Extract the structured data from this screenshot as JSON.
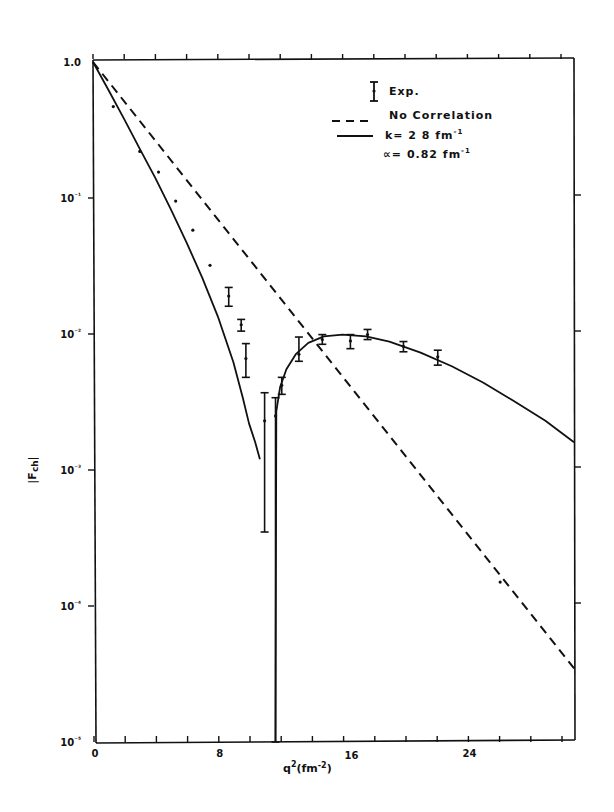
{
  "chart_data": {
    "type": "line",
    "title": "",
    "xlabel": "q²(fm⁻²)",
    "ylabel": "|F_ch|",
    "xscale": "linear",
    "yscale": "log",
    "xlim": [
      0,
      31
    ],
    "ylim": [
      1e-05,
      1.0
    ],
    "x_ticks": [
      0,
      8,
      16,
      24
    ],
    "x_tick_labels": [
      "0",
      "8",
      "16",
      "24"
    ],
    "x_minor_tick_step": 2,
    "y_ticks": [
      1.0,
      0.1,
      0.01,
      0.001,
      0.0001,
      1e-05
    ],
    "y_tick_labels": [
      "1.0",
      "10⁻¹",
      "10⁻²",
      "10⁻³",
      "10⁻⁴",
      "10⁻⁵"
    ],
    "grid": false,
    "legend_position": "upper right",
    "legend": [
      {
        "label": "Exp.",
        "style": "errorbar"
      },
      {
        "label": "No Correlation",
        "style": "dashed"
      },
      {
        "label": "k= 2 8 fm⁻¹",
        "style": "solid"
      },
      {
        "label": "α= 0.82 fm⁻¹",
        "style": "none"
      }
    ],
    "series": [
      {
        "name": "No Correlation",
        "style": "dashed",
        "x": [
          0,
          31
        ],
        "y": [
          1.0,
          3.3e-05
        ]
      },
      {
        "name": "k= 2 8 fm⁻¹, α= 0.82 fm⁻¹",
        "style": "solid",
        "segments": [
          {
            "x": [
              0,
              1,
              2,
              3,
              4,
              5,
              6,
              7,
              8,
              9,
              9.6,
              10,
              10.4,
              10.7
            ],
            "y": [
              1.0,
              0.62,
              0.38,
              0.23,
              0.14,
              0.082,
              0.047,
              0.026,
              0.0135,
              0.0062,
              0.0034,
              0.0022,
              0.0016,
              0.0012
            ]
          },
          {
            "x": [
              11.7,
              11.75,
              12.0,
              12.4,
              13.0,
              13.8,
              14.8,
              16.0,
              17.5,
              19.0,
              21.0,
              23.0,
              25.0,
              27.0,
              29.0,
              31.0
            ],
            "y": [
              1e-05,
              0.0027,
              0.0041,
              0.0055,
              0.0071,
              0.0086,
              0.0096,
              0.0099,
              0.0096,
              0.0088,
              0.0073,
              0.0058,
              0.0044,
              0.0032,
              0.0023,
              0.0016
            ]
          }
        ]
      },
      {
        "name": "Exp.",
        "style": "points_with_errorbars",
        "points": [
          {
            "x": 1.3,
            "y": 0.47
          },
          {
            "x": 3.0,
            "y": 0.22
          },
          {
            "x": 4.2,
            "y": 0.155
          },
          {
            "x": 5.3,
            "y": 0.095
          },
          {
            "x": 6.4,
            "y": 0.058
          },
          {
            "x": 7.5,
            "y": 0.032
          },
          {
            "x": 8.7,
            "y": 0.019,
            "ylo": 0.016,
            "yhi": 0.022
          },
          {
            "x": 9.5,
            "y": 0.0117,
            "ylo": 0.0105,
            "yhi": 0.0128
          },
          {
            "x": 9.8,
            "y": 0.0066,
            "ylo": 0.0048,
            "yhi": 0.0085
          },
          {
            "x": 11.0,
            "y": 0.0023,
            "ylo": 0.00035,
            "yhi": 0.0037
          },
          {
            "x": 11.7,
            "y": 0.0025,
            "ylo": 1e-05,
            "yhi": 0.0034
          },
          {
            "x": 12.1,
            "y": 0.0042,
            "ylo": 0.0036,
            "yhi": 0.0048
          },
          {
            "x": 13.2,
            "y": 0.0071,
            "ylo": 0.0063,
            "yhi": 0.0095
          },
          {
            "x": 14.7,
            "y": 0.0091,
            "ylo": 0.0084,
            "yhi": 0.0099
          },
          {
            "x": 16.5,
            "y": 0.0089,
            "ylo": 0.0078,
            "yhi": 0.0099
          },
          {
            "x": 17.6,
            "y": 0.0099,
            "ylo": 0.0091,
            "yhi": 0.0108
          },
          {
            "x": 19.9,
            "y": 0.0081,
            "ylo": 0.0074,
            "yhi": 0.0088
          },
          {
            "x": 22.1,
            "y": 0.0068,
            "ylo": 0.0059,
            "yhi": 0.0076
          },
          {
            "x": 26.1,
            "y": 0.00015
          }
        ]
      }
    ]
  },
  "labels": {
    "y_axis_title": "|F",
    "y_axis_sub": "ch",
    "x_axis_title_base": "q",
    "x_axis_title_rest": "(fm",
    "x_axis_title_exp": "-2",
    "legend_exp": "Exp.",
    "legend_dashed": "No Correlation",
    "legend_solid": "k= 2 8 fm",
    "legend_solid_exp": "-1",
    "legend_alpha": "∝= 0.82 fm",
    "legend_alpha_exp": "-1"
  }
}
